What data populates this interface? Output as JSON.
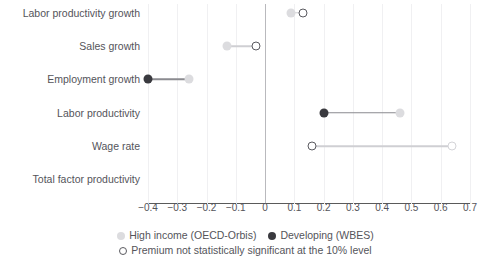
{
  "chart_data": {
    "type": "scatter",
    "title": "",
    "subtitle": "",
    "xlabel": "",
    "ylabel": "",
    "xlim": [
      -0.4,
      0.7
    ],
    "xticks": [
      -0.4,
      -0.3,
      -0.2,
      -0.1,
      0,
      0.1,
      0.2,
      0.3,
      0.4,
      0.5,
      0.6,
      0.7
    ],
    "xticklabels": [
      "−0.4",
      "−0.3",
      "−0.2",
      "−0.1",
      "0",
      "0.1",
      "0.2",
      "0.3",
      "0.4",
      "0.5",
      "0.6",
      "0.7"
    ],
    "grid": true,
    "zero_reference_line": 0,
    "legend_position": "bottom",
    "categories": [
      "Labor productivity growth",
      "Sales growth",
      "Employment growth",
      "Labor productivity",
      "Wage rate",
      "Total factor productivity"
    ],
    "series": [
      {
        "name": "High income (OECD-Orbis)",
        "marker": "filled-circle",
        "color": "#dcdcdf",
        "values": [
          0.09,
          -0.13,
          -0.26,
          0.46,
          0.64,
          null
        ],
        "significant": [
          true,
          true,
          true,
          true,
          false
        ]
      },
      {
        "name": "Developing (WBES)",
        "marker": "filled-circle",
        "color": "#3a3a3f",
        "values": [
          0.13,
          -0.03,
          -0.4,
          0.2,
          0.16,
          null
        ],
        "significant": [
          false,
          false,
          true,
          true,
          false
        ]
      }
    ],
    "points": [
      {
        "category": "Labor productivity growth",
        "series": "High income (OECD-Orbis)",
        "value": 0.09,
        "significant": true,
        "style": "hi-filled"
      },
      {
        "category": "Labor productivity growth",
        "series": "Developing (WBES)",
        "value": 0.13,
        "significant": false,
        "style": "open"
      },
      {
        "category": "Sales growth",
        "series": "High income (OECD-Orbis)",
        "value": -0.13,
        "significant": true,
        "style": "hi-filled"
      },
      {
        "category": "Sales growth",
        "series": "Developing (WBES)",
        "value": -0.03,
        "significant": false,
        "style": "open"
      },
      {
        "category": "Employment growth",
        "series": "Developing (WBES)",
        "value": -0.4,
        "significant": true,
        "style": "dev-filled"
      },
      {
        "category": "Employment growth",
        "series": "High income (OECD-Orbis)",
        "value": -0.26,
        "significant": true,
        "style": "hi-filled"
      },
      {
        "category": "Labor productivity",
        "series": "Developing (WBES)",
        "value": 0.2,
        "significant": true,
        "style": "dev-filled"
      },
      {
        "category": "Labor productivity",
        "series": "High income (OECD-Orbis)",
        "value": 0.46,
        "significant": true,
        "style": "hi-filled"
      },
      {
        "category": "Wage rate",
        "series": "Developing (WBES)",
        "value": 0.16,
        "significant": false,
        "style": "open"
      },
      {
        "category": "Wage rate",
        "series": "High income (OECD-Orbis)",
        "value": 0.64,
        "significant": false,
        "style": "open-light"
      }
    ],
    "connectors": [
      {
        "category": "Labor productivity growth",
        "from": 0.09,
        "to": 0.13,
        "tone": "light"
      },
      {
        "category": "Sales growth",
        "from": -0.13,
        "to": -0.03,
        "tone": "light"
      },
      {
        "category": "Employment growth",
        "from": -0.4,
        "to": -0.26,
        "tone": "dark"
      },
      {
        "category": "Labor productivity",
        "from": 0.2,
        "to": 0.46,
        "tone": "dark"
      },
      {
        "category": "Wage rate",
        "from": 0.16,
        "to": 0.64,
        "tone": "light"
      }
    ]
  },
  "legend": {
    "row1": [
      {
        "label": "High income (OECD-Orbis)",
        "swatch": "sw-hi"
      },
      {
        "label": "Developing (WBES)",
        "swatch": "sw-dev"
      }
    ],
    "row2": [
      {
        "label": "Premium not statistically significant at the 10% level",
        "swatch": "sw-open"
      }
    ]
  }
}
